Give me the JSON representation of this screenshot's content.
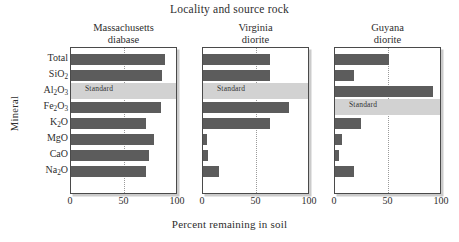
{
  "figure": {
    "super_title": "Locality and source rock",
    "x_axis_title": "Percent remaining in soil",
    "y_axis_title": "Mineral",
    "standard_label": "Standard",
    "bar_color": "#5c5c5c",
    "standard_band_color": "#d2d2d2",
    "frame_color": "#4a4a4a"
  },
  "chart_data": {
    "type": "bar",
    "orientation": "horizontal",
    "title": "Locality and source rock",
    "xlabel": "Percent remaining in soil",
    "ylabel": "Mineral",
    "xlim": [
      0,
      100
    ],
    "xticks": [
      0,
      50,
      100
    ],
    "xtick_labels": [
      "0",
      "50",
      "100"
    ],
    "grid": "vertical dotted at 50",
    "legend": "none",
    "categories": [
      "Total",
      "SiO2",
      "Al2O3",
      "Fe2O3",
      "K2O",
      "MgO",
      "CaO",
      "Na2O"
    ],
    "category_labels_html": [
      "Total",
      "SiO<sub>2</sub>",
      "Al<sub>2</sub>O<sub>3</sub>",
      "Fe<sub>2</sub>O<sub>3</sub>",
      "K<sub>2</sub>O",
      "MgO",
      "CaO",
      "Na<sub>2</sub>O"
    ],
    "panels": [
      {
        "name": "massachusetts-diabase",
        "title_line1": "Massachusetts",
        "title_line2": "diabase",
        "standard_row": "Al2O3",
        "values": [
          88,
          85,
          null,
          84,
          70,
          78,
          73,
          70
        ]
      },
      {
        "name": "virginia-diorite",
        "title_line1": "Virginia",
        "title_line2": "diorite",
        "standard_row": "Al2O3",
        "values": [
          63,
          63,
          null,
          80,
          63,
          4,
          5,
          15
        ]
      },
      {
        "name": "guyana-diorite",
        "title_line1": "Guyana",
        "title_line2": "diorite",
        "standard_row": "Fe2O3",
        "values": [
          50,
          18,
          92,
          null,
          24,
          7,
          4,
          18
        ]
      }
    ]
  }
}
